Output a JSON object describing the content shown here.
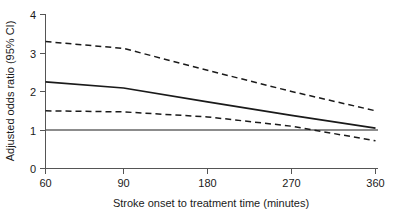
{
  "chart_data": {
    "type": "line",
    "title": "",
    "subtitle": "",
    "xlabel": "Stroke onset to treatment time (minutes)",
    "ylabel": "Adjusted odds ratio (95% CI)",
    "x": [
      60,
      90,
      180,
      270,
      360
    ],
    "xtick_labels": [
      "60",
      "90",
      "180",
      "270",
      "360"
    ],
    "ytick_labels": [
      "0",
      "1",
      "2",
      "3",
      "4"
    ],
    "yticks": [
      0,
      1,
      2,
      3,
      4
    ],
    "ylim": [
      0,
      4
    ],
    "xlim": [
      60,
      360
    ],
    "x_axis_scale": "non-linear (equal spacing between labelled ticks)",
    "grid": false,
    "legend": false,
    "legend_position": "none",
    "series": [
      {
        "name": "Adjusted odds ratio",
        "style": "solid",
        "color": "#1a1a1a",
        "values": [
          2.25,
          2.09,
          1.73,
          1.38,
          1.05
        ]
      },
      {
        "name": "Upper 95% confidence limit",
        "style": "dashed",
        "color": "#1a1a1a",
        "values": [
          3.3,
          3.12,
          2.55,
          2.0,
          1.5
        ]
      },
      {
        "name": "Lower 95% confidence limit",
        "style": "dashed",
        "color": "#1a1a1a",
        "values": [
          1.5,
          1.47,
          1.34,
          1.1,
          0.72
        ]
      }
    ],
    "reference_line": {
      "name": "No effect reference line",
      "axis": "y",
      "value": 1,
      "style": "solid",
      "color": "#8c8c8c"
    },
    "annotations": []
  },
  "axis": {
    "y_title": "Adjusted odds ratio (95% CI)",
    "x_title": "Stroke onset to treatment time (minutes)",
    "y_tick_0": "0",
    "y_tick_1": "1",
    "y_tick_2": "2",
    "y_tick_3": "3",
    "y_tick_4": "4",
    "x_tick_60": "60",
    "x_tick_90": "90",
    "x_tick_180": "180",
    "x_tick_270": "270",
    "x_tick_360": "360"
  },
  "colors": {
    "line": "#1a1a1a",
    "reference": "#8c8c8c",
    "axis": "#555555",
    "background": "#ffffff"
  }
}
